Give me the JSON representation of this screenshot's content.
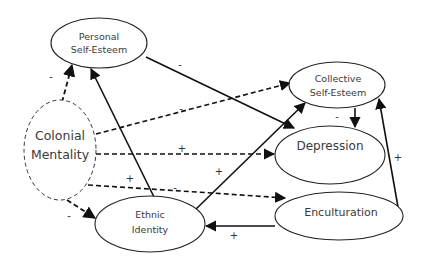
{
  "diagram": {
    "nodes": {
      "personal_self_esteem": {
        "line1": "Personal",
        "line2": "Self-Esteem"
      },
      "collective_self_esteem": {
        "line1": "Collective",
        "line2": "Self-Esteem"
      },
      "colonial_mentality": {
        "line1": "Colonial",
        "line2": "Mentality"
      },
      "depression": {
        "label": "Depression"
      },
      "enculturation": {
        "label": "Enculturation"
      },
      "ethnic_identity": {
        "line1": "Ethnic",
        "line2": "Identity"
      }
    },
    "edges": [
      {
        "from": "Colonial Mentality",
        "to": "Personal Self-Esteem",
        "style": "dashed",
        "sign": "-"
      },
      {
        "from": "Colonial Mentality",
        "to": "Collective Self-Esteem",
        "style": "dashed",
        "sign": "-"
      },
      {
        "from": "Colonial Mentality",
        "to": "Depression",
        "style": "dashed",
        "sign": "+"
      },
      {
        "from": "Colonial Mentality",
        "to": "Enculturation",
        "style": "dashed",
        "sign": "-"
      },
      {
        "from": "Colonial Mentality",
        "to": "Ethnic Identity",
        "style": "dashed",
        "sign": "-"
      },
      {
        "from": "Personal Self-Esteem",
        "to": "Depression",
        "style": "solid",
        "sign": "-"
      },
      {
        "from": "Collective Self-Esteem",
        "to": "Depression",
        "style": "solid",
        "sign": "-"
      },
      {
        "from": "Ethnic Identity",
        "to": "Personal Self-Esteem",
        "style": "solid",
        "sign": "+"
      },
      {
        "from": "Ethnic Identity",
        "to": "Collective Self-Esteem",
        "style": "solid",
        "sign": "+"
      },
      {
        "from": "Enculturation",
        "to": "Ethnic Identity",
        "style": "solid",
        "sign": "+"
      },
      {
        "from": "Enculturation",
        "to": "Collective Self-Esteem",
        "style": "solid",
        "sign": "+"
      }
    ],
    "signs": {
      "cm_pse": "-",
      "pse_dep": "-",
      "cm_cse": "-",
      "cm_dep": "+",
      "ei_pse": "+",
      "cm_enc": "-",
      "ei_cse": "+",
      "cse_dep": "-",
      "enc_cse": "+",
      "cm_ei": "-",
      "enc_ei": "+"
    }
  }
}
